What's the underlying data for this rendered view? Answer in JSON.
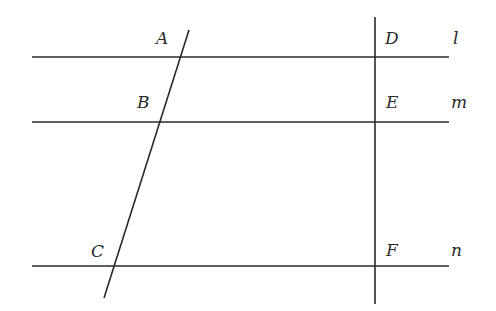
{
  "diagram": {
    "colors": {
      "stroke": "#2a2a2a",
      "background": "#ffffff"
    },
    "lines": [
      {
        "name": "l",
        "x1": 32,
        "y1": 57,
        "x2": 449,
        "y2": 57
      },
      {
        "name": "m",
        "x1": 32,
        "y1": 122,
        "x2": 449,
        "y2": 122
      },
      {
        "name": "n",
        "x1": 32,
        "y1": 266,
        "x2": 449,
        "y2": 266
      },
      {
        "name": "transversal-ac",
        "x1": 189,
        "y1": 30,
        "x2": 104,
        "y2": 298
      },
      {
        "name": "transversal-df",
        "x1": 375,
        "y1": 17,
        "x2": 375,
        "y2": 304
      }
    ],
    "points": [
      {
        "label": "A",
        "x": 156,
        "y": 30
      },
      {
        "label": "B",
        "x": 137,
        "y": 94
      },
      {
        "label": "C",
        "x": 91,
        "y": 243
      },
      {
        "label": "D",
        "x": 385,
        "y": 30
      },
      {
        "label": "E",
        "x": 386,
        "y": 94
      },
      {
        "label": "F",
        "x": 386,
        "y": 242
      }
    ],
    "line_labels": [
      {
        "label": "l",
        "x": 453,
        "y": 30
      },
      {
        "label": "m",
        "x": 451,
        "y": 94
      },
      {
        "label": "n",
        "x": 451,
        "y": 242
      }
    ]
  }
}
